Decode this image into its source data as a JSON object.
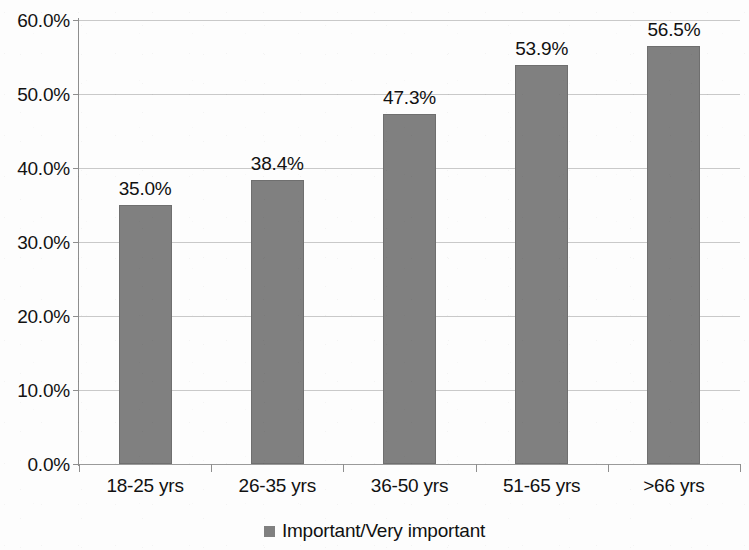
{
  "chart_data": {
    "type": "bar",
    "title": "",
    "xlabel": "",
    "ylabel": "",
    "categories": [
      "18-25 yrs",
      "26-35 yrs",
      "36-50 yrs",
      "51-65 yrs",
      ">66 yrs"
    ],
    "values": [
      35.0,
      38.4,
      47.3,
      53.9,
      56.5
    ],
    "value_labels": [
      "35.0%",
      "38.4%",
      "47.3%",
      "53.9%",
      "56.5%"
    ],
    "series": [
      {
        "name": "Important/Very important",
        "values": [
          35.0,
          38.4,
          47.3,
          53.9,
          56.5
        ],
        "color": "#808080"
      }
    ],
    "ylim": [
      0,
      60
    ],
    "ytick_values": [
      0,
      10,
      20,
      30,
      40,
      50,
      60
    ],
    "ytick_labels": [
      "0.0%",
      "10.0%",
      "20.0%",
      "30.0%",
      "40.0%",
      "50.0%",
      "60.0%"
    ],
    "grid": true,
    "grid_axis": "y",
    "legend": {
      "position": "bottom-center",
      "entries": [
        {
          "label": "Important/Very important",
          "color": "#808080",
          "marker": "square"
        }
      ]
    },
    "bar_color": "#808080",
    "gridline_color": "#c9c9c9",
    "axis_color": "#8e8e8e",
    "background_color": "#fdfdfd"
  },
  "legend": {
    "entry_label": "Important/Very important"
  }
}
